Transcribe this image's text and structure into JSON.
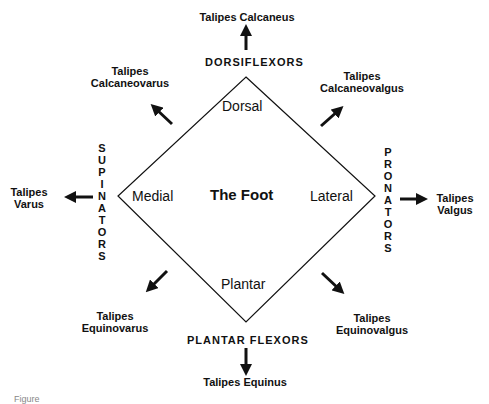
{
  "diagram": {
    "center_label": "The Foot",
    "inner_labels": {
      "top": "Dorsal",
      "bottom": "Plantar",
      "left": "Medial",
      "right": "Lateral"
    },
    "muscle_groups": {
      "top": "DORSIFLEXORS",
      "bottom": "PLANTAR FLEXORS",
      "left": "SUPINATORS",
      "right": "PRONATORS"
    },
    "deformities": {
      "top": "Talipes Calcaneus",
      "bottom": "Talipes Equinus",
      "left_1": "Talipes",
      "left_2": "Varus",
      "right_1": "Talipes",
      "right_2": "Valgus",
      "top_left_1": "Talipes",
      "top_left_2": "Calcaneovarus",
      "top_right_1": "Talipes",
      "top_right_2": "Calcaneovalgus",
      "bottom_left_1": "Talipes",
      "bottom_left_2": "Equinovarus",
      "bottom_right_1": "Talipes",
      "bottom_right_2": "Equinovalgus"
    },
    "caption": "Figure"
  }
}
